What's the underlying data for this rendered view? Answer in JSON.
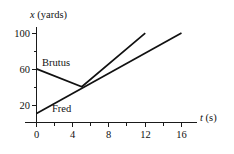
{
  "chart_data": {
    "type": "line",
    "title": "",
    "xlabel": "t (s)",
    "ylabel": "x (yards)",
    "xlabel_var": "t",
    "xlabel_unit": "(s)",
    "ylabel_var": "x",
    "ylabel_unit": "(yards)",
    "xlim": [
      0,
      17.8
    ],
    "ylim": [
      0,
      112
    ],
    "grid": false,
    "legend": "inline-labels",
    "x_ticks_major": [
      0,
      4,
      8,
      12,
      16
    ],
    "x_ticks_major_labels": [
      "0",
      "4",
      "8",
      "12",
      "16"
    ],
    "x_ticks_minor": [
      2,
      6,
      10,
      14
    ],
    "y_ticks_major": [
      20,
      60,
      100
    ],
    "y_ticks_major_labels": [
      "20",
      "60",
      "100"
    ],
    "y_ticks_minor": [
      40,
      80
    ],
    "series": [
      {
        "name": "Brutus",
        "label": "Brutus",
        "color": "#111111",
        "points": [
          [
            0,
            60
          ],
          [
            5,
            40
          ],
          [
            12,
            100
          ]
        ]
      },
      {
        "name": "Fred",
        "label": "Fred",
        "color": "#111111",
        "points": [
          [
            0,
            10
          ],
          [
            16,
            100
          ]
        ]
      }
    ],
    "annotations": [
      {
        "text": "Brutus",
        "x": 2.2,
        "y": 64
      },
      {
        "text": "Fred",
        "x": 3.4,
        "y": 14
      }
    ]
  }
}
